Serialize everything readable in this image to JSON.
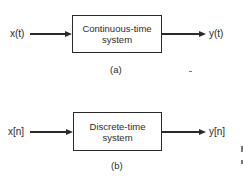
{
  "diagrams": [
    {
      "id": "a",
      "input_label": "x(t)",
      "system_line1": "Continuous-time",
      "system_line2": "system",
      "output_label": "y(t)",
      "caption": "(a)"
    },
    {
      "id": "b",
      "input_label": "x[n]",
      "system_line1": "Discrete-time",
      "system_line2": "system",
      "output_label": "y[n]",
      "caption": "(b)"
    }
  ],
  "colors": {
    "ink": "#2a2a2a",
    "background": "#ffffff"
  }
}
